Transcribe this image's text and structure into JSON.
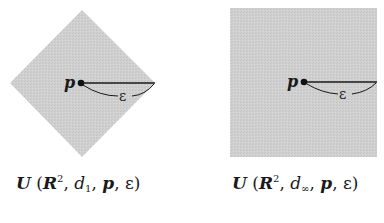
{
  "panels": [
    {
      "shape": "diamond",
      "metric": "d1",
      "point_label": "p",
      "radius_label": "ε",
      "caption": {
        "func": "U",
        "open": " (",
        "space": "R",
        "space_exp": "2",
        "sep1": ", ",
        "metric_base": "d",
        "metric_sub": "1",
        "sep2": ", ",
        "point": "p",
        "sep3": ", ",
        "radius": "ε",
        "close": ")"
      }
    },
    {
      "shape": "square",
      "metric": "d∞",
      "point_label": "p",
      "radius_label": "ε",
      "caption": {
        "func": "U",
        "open": " (",
        "space": "R",
        "space_exp": "2",
        "sep1": ", ",
        "metric_base": "d",
        "metric_sub": "∞",
        "sep2": ", ",
        "point": "p",
        "sep3": ", ",
        "radius": "ε",
        "close": ")"
      }
    }
  ],
  "colors": {
    "fill": "#cfcfcf",
    "ink": "#1a1a1a",
    "background": "#ffffff"
  }
}
